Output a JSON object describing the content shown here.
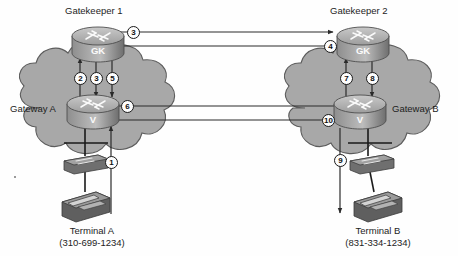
{
  "diagram": {
    "type": "network-call-flow",
    "background_color": "#ffffff",
    "cloud_fill": "#a8a8a8",
    "cloud_stroke": "#5a5a5a",
    "device_fill": "#8c8c8c",
    "line_color": "#2a2a2a",
    "text_color": "#1d1d1d"
  },
  "nodes": {
    "gatekeeper1": {
      "label": "Gatekeeper 1",
      "device_text": "GK",
      "device_type": "router-gatekeeper",
      "x": 97,
      "y": 42
    },
    "gatekeeper2": {
      "label": "Gatekeeper 2",
      "device_text": "GK",
      "device_type": "router-gatekeeper",
      "x": 360,
      "y": 42
    },
    "gatewayA": {
      "label": "Gateway A",
      "device_text": "V",
      "device_type": "router-voice-gateway",
      "x": 93,
      "y": 110
    },
    "gatewayB": {
      "label": "Gateway B",
      "device_text": "V",
      "device_type": "router-voice-gateway",
      "x": 360,
      "y": 110
    },
    "switchA": {
      "label": "",
      "device_type": "switch",
      "x": 85,
      "y": 160
    },
    "switchB": {
      "label": "",
      "device_type": "switch",
      "x": 370,
      "y": 160
    },
    "terminalA": {
      "label": "Terminal A",
      "phone": "(310-699-1234)",
      "device_type": "ip-phone",
      "x": 82,
      "y": 205
    },
    "terminalB": {
      "label": "Terminal B",
      "phone": "(831-334-1234)",
      "device_type": "ip-phone",
      "x": 372,
      "y": 205
    }
  },
  "clouds": [
    {
      "name": "cloud-left",
      "label": "Gateway A"
    },
    {
      "name": "cloud-right",
      "label": "Gateway B"
    }
  ],
  "steps": [
    {
      "number": "1",
      "from": "terminalA",
      "to": "gatewayA",
      "direction": "up",
      "cx": 111,
      "cy": 162
    },
    {
      "number": "2",
      "from": "gatewayA",
      "to": "gatekeeper1",
      "direction": "up",
      "cx": 80,
      "cy": 78
    },
    {
      "number": "3",
      "from": "gatekeeper1",
      "to": "gatewayA",
      "direction": "down",
      "cx": 96,
      "cy": 78
    },
    {
      "number": "3",
      "from": "gatekeeper1",
      "to": "gatekeeper2",
      "direction": "right",
      "cx": 133,
      "cy": 32
    },
    {
      "number": "4",
      "from": "gatekeeper2",
      "to": "gatekeeper1",
      "direction": "left",
      "cx": 330,
      "cy": 46
    },
    {
      "number": "5",
      "from": "gatekeeper1",
      "to": "gatewayA",
      "direction": "down",
      "cx": 112,
      "cy": 78
    },
    {
      "number": "6",
      "from": "gatewayA",
      "to": "gatewayB",
      "direction": "right",
      "cx": 127,
      "cy": 106
    },
    {
      "number": "7",
      "from": "gatewayB",
      "to": "gatekeeper2",
      "direction": "up",
      "cx": 346,
      "cy": 78
    },
    {
      "number": "8",
      "from": "gatekeeper2",
      "to": "gatewayB",
      "direction": "down",
      "cx": 372,
      "cy": 78
    },
    {
      "number": "9",
      "from": "gatewayB",
      "to": "terminalB",
      "direction": "down",
      "cx": 340,
      "cy": 160
    },
    {
      "number": "10",
      "from": "gatewayB",
      "to": "gatewayA",
      "direction": "left",
      "cx": 329,
      "cy": 120
    }
  ]
}
